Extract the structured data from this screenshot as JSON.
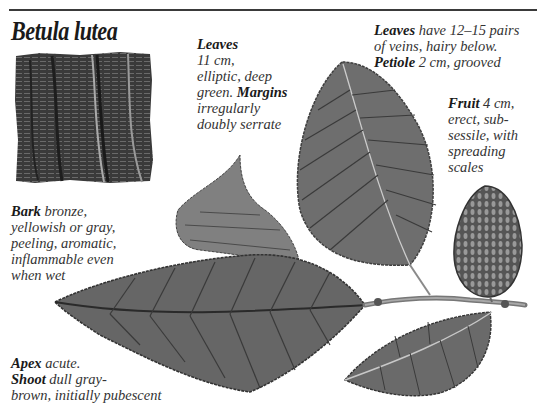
{
  "title": "Betula lutea",
  "annotations": {
    "leaves_size": {
      "label": "Leaves",
      "lines": [
        "11 cm,",
        "elliptic, deep",
        "green."
      ],
      "label2": "Margins",
      "lines2": [
        "irregularly",
        "doubly serrate"
      ]
    },
    "leaves_veins": {
      "label": "Leaves",
      "line1_rest": "have 12–15 pairs",
      "line2": "of veins, hairy below.",
      "label2": "Petiole",
      "line3_rest": "2 cm, grooved"
    },
    "fruit": {
      "label": "Fruit",
      "line1_rest": "4 cm,",
      "lines": [
        "erect, sub-",
        "sessile, with",
        "spreading",
        "scales"
      ]
    },
    "bark": {
      "label": "Bark",
      "line1_rest": "bronze,",
      "lines": [
        "yellowish or gray,",
        "peeling, aromatic,",
        "inflammable even",
        "when wet"
      ]
    },
    "apex_shoot": {
      "label": "Apex",
      "line1_rest": "acute.",
      "label2": "Shoot",
      "line2_rest": "dull gray-",
      "line3": "brown, initially pubescent"
    }
  },
  "illustrations": {
    "bark": "bark-texture-illustration",
    "leaf_upper": "upright-leaf-illustration",
    "leaf_curled": "curled-leaf-illustration",
    "leaf_large": "large-leaf-illustration",
    "leaf_small": "small-leaf-illustration",
    "fruit": "catkin-fruit-illustration",
    "twig": "twig-illustration"
  }
}
